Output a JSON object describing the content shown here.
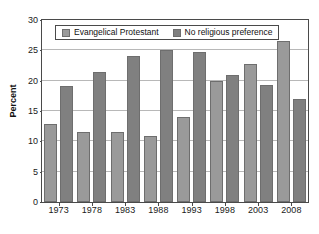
{
  "chart_data": {
    "type": "bar",
    "title": "",
    "xlabel": "",
    "ylabel": "Percent",
    "categories": [
      "1973",
      "1978",
      "1983",
      "1988",
      "1993",
      "1998",
      "2003",
      "2008"
    ],
    "series": [
      {
        "name": "Evangelical Protestant",
        "color": "#9a9a9a",
        "values": [
          12.8,
          11.6,
          11.6,
          10.9,
          14.0,
          20.0,
          22.8,
          26.5
        ]
      },
      {
        "name": "No religious preference",
        "color": "#808080",
        "values": [
          19.1,
          21.5,
          24.1,
          25.0,
          24.8,
          21.0,
          19.3,
          17.0
        ]
      }
    ],
    "ylim": [
      0,
      30
    ],
    "ytick_values": [
      0,
      5,
      10,
      15,
      20,
      25,
      30
    ],
    "ytick_labels": [
      "0",
      "5",
      "10",
      "15",
      "20",
      "25",
      "30"
    ],
    "grid": true,
    "grid_axis": "y",
    "legend_position": "top-center",
    "legend_entries": [
      "Evangelical Protestant",
      "No religious preference"
    ]
  }
}
